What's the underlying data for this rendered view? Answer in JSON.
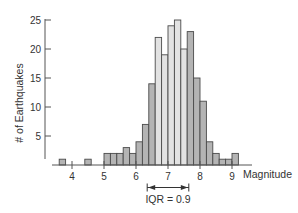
{
  "chart_data": {
    "type": "bar",
    "title": "",
    "xlabel": "Magnitude",
    "ylabel": "# of Earthquakes",
    "bin_width": 0.2,
    "bins_start": [
      3.6,
      4.4,
      5.0,
      5.2,
      5.4,
      5.6,
      5.8,
      6.0,
      6.2,
      6.4,
      6.6,
      6.8,
      7.0,
      7.2,
      7.4,
      7.6,
      7.8,
      8.0,
      8.2,
      8.4,
      8.6,
      8.8,
      9.0
    ],
    "values": [
      1,
      1,
      2,
      2,
      2,
      3,
      2,
      4,
      7,
      14,
      22,
      19,
      24,
      25,
      20,
      23,
      15,
      11,
      4,
      2,
      1,
      1,
      2
    ],
    "highlighted_range": [
      6.6,
      7.6
    ],
    "xlim": [
      3.2,
      9.6
    ],
    "ylim": [
      0,
      25
    ],
    "x_ticks": [
      4,
      5,
      6,
      7,
      8,
      9
    ],
    "y_ticks": [
      5,
      10,
      15,
      20,
      25
    ],
    "grid": false,
    "legend": null,
    "annotations": [
      {
        "text": "IQR = 0.9",
        "type": "double-arrow",
        "x_from": 6.35,
        "x_to": 7.65
      }
    ],
    "colors": {
      "bar": "#b4b4b4",
      "bar_highlight": "#e2e2e2",
      "bar_edge": "#4a4a4a",
      "axis": "#555555"
    }
  }
}
